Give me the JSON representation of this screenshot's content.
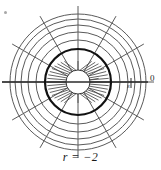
{
  "figure": {
    "caption": "r = −2",
    "axis_zero_label": "0",
    "axis_minor_label": "s",
    "type": "polar-grid-conformal-map",
    "colors": {
      "grid_line": "#5a5a5a",
      "bold_circle": "#111111",
      "axis_line": "#2b2b2b",
      "background": "#ffffff",
      "caption_text": "#1a1a1a",
      "inner_spoke": "#4a4a4a"
    },
    "geometry": {
      "center_x": 78,
      "center_y": 82,
      "inner_circle_radius": 12,
      "bold_circle_radius": 33,
      "outer_circle_radii": [
        42,
        50,
        57,
        63,
        68
      ],
      "inner_spoke_count": 36,
      "radial_spoke_count": 12,
      "radial_spoke_start_radius": 12,
      "radial_spoke_end_radius": 76,
      "axis_line_x_start": 2,
      "axis_line_x_end": 148,
      "grid_stroke_width": 1,
      "bold_stroke_width": 2.2
    }
  }
}
